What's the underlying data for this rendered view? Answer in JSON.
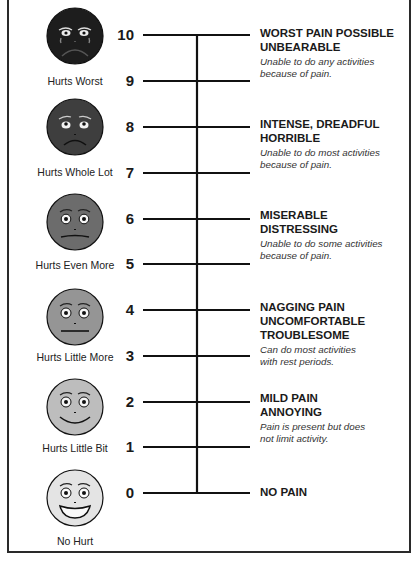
{
  "colors": {
    "border": "#2a2a2a",
    "line": "#111111",
    "face_fills": [
      "#e4e4e4",
      "#bdbdbd",
      "#959595",
      "#6c6c6c",
      "#3e3e3e",
      "#1d1d1d"
    ]
  },
  "scale": {
    "numbers": [
      "10",
      "9",
      "8",
      "7",
      "6",
      "5",
      "4",
      "3",
      "2",
      "1",
      "0"
    ]
  },
  "faces": [
    {
      "label": "Hurts Worst",
      "icon": "crying-face-icon",
      "level": 10
    },
    {
      "label": "Hurts Whole Lot",
      "icon": "sad-face-icon",
      "level": 8
    },
    {
      "label": "Hurts Even More",
      "icon": "frowning-face-icon",
      "level": 6
    },
    {
      "label": "Hurts Little More",
      "icon": "neutral-face-icon",
      "level": 4
    },
    {
      "label": "Hurts Little Bit",
      "icon": "smiling-face-icon",
      "level": 2
    },
    {
      "label": "No Hurt",
      "icon": "grinning-face-icon",
      "level": 0
    }
  ],
  "descriptions": [
    {
      "level": 10,
      "heading_lines": [
        "WORST PAIN POSSIBLE",
        "UNBEARABLE"
      ],
      "detail_lines": [
        "Unable to do any activities",
        "because of pain."
      ]
    },
    {
      "level": 8,
      "heading_lines": [
        "INTENSE, DREADFUL",
        "HORRIBLE"
      ],
      "detail_lines": [
        "Unable to do most activities",
        "because of pain."
      ]
    },
    {
      "level": 6,
      "heading_lines": [
        "MISERABLE",
        "DISTRESSING"
      ],
      "detail_lines": [
        "Unable to do some activities",
        "because of pain."
      ]
    },
    {
      "level": 4,
      "heading_lines": [
        "NAGGING PAIN",
        "UNCOMFORTABLE",
        "TROUBLESOME"
      ],
      "detail_lines": [
        "Can do most activities",
        "with rest periods."
      ]
    },
    {
      "level": 2,
      "heading_lines": [
        "MILD PAIN",
        "ANNOYING"
      ],
      "detail_lines": [
        "Pain is present but does",
        "not limit activity."
      ]
    },
    {
      "level": 0,
      "heading_lines": [
        "NO PAIN"
      ],
      "detail_lines": []
    }
  ]
}
